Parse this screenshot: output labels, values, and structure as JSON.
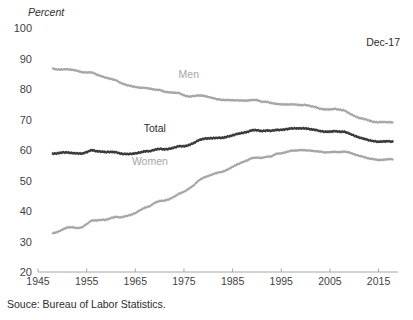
{
  "figure": {
    "unit_label": "Percent",
    "annotation": "Dec-17",
    "source_note": "Souce: Bureau of Labor Statistics."
  },
  "chart_data": {
    "type": "line",
    "title": "",
    "subtitle": "",
    "xlabel": "",
    "ylabel": "Percent",
    "xlim": [
      1945,
      2019
    ],
    "ylim": [
      20,
      100
    ],
    "grid": false,
    "legend_position": "inline-labels",
    "xticks": [
      1945,
      1955,
      1965,
      1975,
      1985,
      1995,
      2005,
      2015
    ],
    "yticks": [
      20,
      30,
      40,
      50,
      60,
      70,
      80,
      90,
      100
    ],
    "annotations": [
      {
        "text": "Dec-17",
        "x": 2012,
        "y": 95
      }
    ],
    "series": [
      {
        "name": "Men",
        "color": "#a6a6a6",
        "label_x": 1976,
        "label_y": 83.5,
        "x": [
          1948,
          1949,
          1950,
          1951,
          1952,
          1953,
          1954,
          1955,
          1956,
          1957,
          1958,
          1959,
          1960,
          1961,
          1962,
          1963,
          1964,
          1965,
          1966,
          1967,
          1968,
          1969,
          1970,
          1971,
          1972,
          1973,
          1974,
          1975,
          1976,
          1977,
          1978,
          1979,
          1980,
          1981,
          1982,
          1983,
          1984,
          1985,
          1986,
          1987,
          1988,
          1989,
          1990,
          1991,
          1992,
          1993,
          1994,
          1995,
          1996,
          1997,
          1998,
          1999,
          2000,
          2001,
          2002,
          2003,
          2004,
          2005,
          2006,
          2007,
          2008,
          2009,
          2010,
          2011,
          2012,
          2013,
          2014,
          2015,
          2016,
          2017,
          2017.95
        ],
        "values": [
          86.7,
          86.4,
          86.4,
          86.5,
          86.3,
          86.0,
          85.5,
          85.4,
          85.5,
          84.8,
          84.2,
          83.7,
          83.3,
          82.9,
          82.0,
          81.4,
          81.0,
          80.7,
          80.4,
          80.4,
          80.1,
          79.8,
          79.7,
          79.1,
          78.9,
          78.8,
          78.7,
          77.9,
          77.5,
          77.7,
          77.9,
          77.8,
          77.4,
          77.0,
          76.6,
          76.4,
          76.4,
          76.3,
          76.3,
          76.2,
          76.2,
          76.4,
          76.4,
          75.8,
          75.8,
          75.4,
          75.1,
          75.0,
          74.9,
          75.0,
          74.9,
          74.7,
          74.8,
          74.4,
          74.1,
          73.5,
          73.3,
          73.3,
          73.5,
          73.2,
          73.0,
          72.0,
          71.2,
          70.5,
          70.2,
          69.7,
          69.2,
          69.1,
          69.2,
          69.1,
          69.1
        ]
      },
      {
        "name": "Total",
        "color": "#3a3a3a",
        "label_x": 1969,
        "label_y": 66.0,
        "x": [
          1948,
          1949,
          1950,
          1951,
          1952,
          1953,
          1954,
          1955,
          1956,
          1957,
          1958,
          1959,
          1960,
          1961,
          1962,
          1963,
          1964,
          1965,
          1966,
          1967,
          1968,
          1969,
          1970,
          1971,
          1972,
          1973,
          1974,
          1975,
          1976,
          1977,
          1978,
          1979,
          1980,
          1981,
          1982,
          1983,
          1984,
          1985,
          1986,
          1987,
          1988,
          1989,
          1990,
          1991,
          1992,
          1993,
          1994,
          1995,
          1996,
          1997,
          1998,
          1999,
          2000,
          2001,
          2002,
          2003,
          2004,
          2005,
          2006,
          2007,
          2008,
          2009,
          2010,
          2011,
          2012,
          2013,
          2014,
          2015,
          2016,
          2017,
          2017.95
        ],
        "values": [
          58.8,
          58.9,
          59.2,
          59.2,
          59.0,
          58.9,
          58.8,
          59.3,
          60.0,
          59.6,
          59.5,
          59.3,
          59.4,
          59.3,
          58.8,
          58.7,
          58.7,
          58.9,
          59.2,
          59.6,
          59.6,
          60.1,
          60.4,
          60.2,
          60.4,
          60.8,
          61.3,
          61.2,
          61.6,
          62.3,
          63.2,
          63.7,
          63.8,
          63.9,
          64.0,
          64.0,
          64.4,
          64.8,
          65.3,
          65.6,
          65.9,
          66.5,
          66.5,
          66.2,
          66.4,
          66.3,
          66.6,
          66.6,
          66.8,
          67.1,
          67.1,
          67.1,
          67.1,
          66.8,
          66.6,
          66.2,
          66.0,
          66.0,
          66.2,
          66.0,
          66.0,
          65.4,
          64.7,
          64.1,
          63.7,
          63.2,
          62.9,
          62.7,
          62.8,
          62.9,
          62.7
        ]
      },
      {
        "name": "Women",
        "color": "#a6a6a6",
        "label_x": 1968,
        "label_y": 55.0,
        "x": [
          1948,
          1949,
          1950,
          1951,
          1952,
          1953,
          1954,
          1955,
          1956,
          1957,
          1958,
          1959,
          1960,
          1961,
          1962,
          1963,
          1964,
          1965,
          1966,
          1967,
          1968,
          1969,
          1970,
          1971,
          1972,
          1973,
          1974,
          1975,
          1976,
          1977,
          1978,
          1979,
          1980,
          1981,
          1982,
          1983,
          1984,
          1985,
          1986,
          1987,
          1988,
          1989,
          1990,
          1991,
          1992,
          1993,
          1994,
          1995,
          1996,
          1997,
          1998,
          1999,
          2000,
          2001,
          2002,
          2003,
          2004,
          2005,
          2006,
          2007,
          2008,
          2009,
          2010,
          2011,
          2012,
          2013,
          2014,
          2015,
          2016,
          2017,
          2017.95
        ],
        "values": [
          32.7,
          33.1,
          33.9,
          34.6,
          34.7,
          34.4,
          34.6,
          35.7,
          36.9,
          36.9,
          37.1,
          37.1,
          37.7,
          38.1,
          37.9,
          38.3,
          38.7,
          39.3,
          40.3,
          41.1,
          41.6,
          42.7,
          43.3,
          43.4,
          43.9,
          44.7,
          45.7,
          46.3,
          47.3,
          48.4,
          50.0,
          50.9,
          51.5,
          52.1,
          52.6,
          52.9,
          53.6,
          54.5,
          55.3,
          56.0,
          56.6,
          57.4,
          57.5,
          57.4,
          57.8,
          57.9,
          58.8,
          58.9,
          59.3,
          59.8,
          59.8,
          60.0,
          59.9,
          59.8,
          59.6,
          59.5,
          59.2,
          59.3,
          59.4,
          59.3,
          59.5,
          59.2,
          58.6,
          58.1,
          57.7,
          57.2,
          57.0,
          56.7,
          56.8,
          57.0,
          57.0
        ]
      }
    ]
  }
}
